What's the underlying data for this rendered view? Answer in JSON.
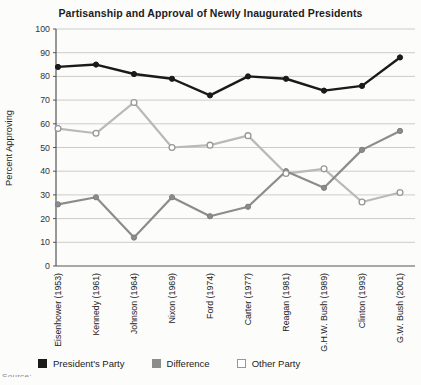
{
  "figure": {
    "source_clipped": "Source:"
  },
  "chart_data": {
    "type": "line",
    "title": "Partisanship and Approval of Newly Inaugurated Presidents",
    "xlabel": "",
    "ylabel": "Percent Approving",
    "ylim": [
      0,
      100
    ],
    "ytick_step": 10,
    "grid": true,
    "legend_position": "bottom",
    "x_tick_label_rotation": 90,
    "categories": [
      "Eisenhower (1953)",
      "Kennedy (1961)",
      "Johnson (1964)",
      "Nixon (1969)",
      "Ford (1974)",
      "Carter (1977)",
      "Reagan (1981)",
      "G.H.W. Bush (1989)",
      "Clinton (1993)",
      "G.W. Bush (2001)"
    ],
    "series": [
      {
        "name": "President's Party",
        "key": "presidents-party",
        "color": "#1a1a1a",
        "line_width": 2.4,
        "marker": "filled-circle",
        "marker_fill": "#1a1a1a",
        "marker_stroke": "#1a1a1a",
        "values": [
          84,
          85,
          81,
          79,
          72,
          80,
          79,
          74,
          76,
          88
        ]
      },
      {
        "name": "Difference",
        "key": "difference",
        "color": "#8c8c8c",
        "line_width": 2.2,
        "marker": "filled-circle",
        "marker_fill": "#8c8c8c",
        "marker_stroke": "#7d7d7d",
        "values": [
          26,
          29,
          12,
          29,
          21,
          25,
          40,
          33,
          49,
          57
        ]
      },
      {
        "name": "Other Party",
        "key": "other-party",
        "color": "#b9b9b9",
        "line_width": 2.2,
        "marker": "open-circle",
        "marker_fill": "#ffffff",
        "marker_stroke": "#979797",
        "values": [
          58,
          56,
          69,
          50,
          51,
          55,
          39,
          41,
          27,
          31
        ]
      }
    ],
    "axis_color": "#555555",
    "gridline_color": "#cccccc",
    "tick_label_color": "#333333"
  }
}
